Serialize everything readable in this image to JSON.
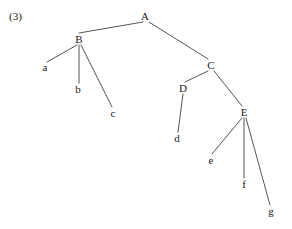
{
  "figure": {
    "item_number": "(3)",
    "type": "tree-diagram",
    "line_color": "#555555",
    "text_color": "#1a1a1a",
    "background_color": "#ffffff",
    "nodes": [
      {
        "id": "A",
        "label": "A",
        "x": 145,
        "y": 16
      },
      {
        "id": "B",
        "label": "B",
        "x": 79,
        "y": 39
      },
      {
        "id": "C",
        "label": "C",
        "x": 211,
        "y": 65
      },
      {
        "id": "D",
        "label": "D",
        "x": 183,
        "y": 88
      },
      {
        "id": "E",
        "label": "E",
        "x": 244,
        "y": 112
      },
      {
        "id": "a",
        "label": "a",
        "x": 45,
        "y": 67
      },
      {
        "id": "b",
        "label": "b",
        "x": 78,
        "y": 89
      },
      {
        "id": "c",
        "label": "c",
        "x": 113,
        "y": 113
      },
      {
        "id": "d",
        "label": "d",
        "x": 177,
        "y": 138
      },
      {
        "id": "e",
        "label": "e",
        "x": 211,
        "y": 160
      },
      {
        "id": "f",
        "label": "f",
        "x": 244,
        "y": 184
      },
      {
        "id": "g",
        "label": "g",
        "x": 271,
        "y": 211
      }
    ],
    "edges": [
      {
        "from": "A",
        "to": "B",
        "x1": 143,
        "y1": 22,
        "x2": 79,
        "y2": 33
      },
      {
        "from": "A",
        "to": "C",
        "x1": 149,
        "y1": 22,
        "x2": 208,
        "y2": 59
      },
      {
        "from": "B",
        "to": "a",
        "x1": 77,
        "y1": 45,
        "x2": 47,
        "y2": 62
      },
      {
        "from": "B",
        "to": "b",
        "x1": 79,
        "y1": 45,
        "x2": 79,
        "y2": 83
      },
      {
        "from": "B",
        "to": "c",
        "x1": 81,
        "y1": 45,
        "x2": 112,
        "y2": 107
      },
      {
        "from": "C",
        "to": "D",
        "x1": 208,
        "y1": 71,
        "x2": 185,
        "y2": 82
      },
      {
        "from": "C",
        "to": "E",
        "x1": 214,
        "y1": 71,
        "x2": 242,
        "y2": 106
      },
      {
        "from": "D",
        "to": "d",
        "x1": 183,
        "y1": 94,
        "x2": 178,
        "y2": 132
      },
      {
        "from": "E",
        "to": "e",
        "x1": 242,
        "y1": 118,
        "x2": 212,
        "y2": 154
      },
      {
        "from": "E",
        "to": "f",
        "x1": 244,
        "y1": 118,
        "x2": 244,
        "y2": 178
      },
      {
        "from": "E",
        "to": "g",
        "x1": 246,
        "y1": 118,
        "x2": 270,
        "y2": 205
      }
    ]
  }
}
